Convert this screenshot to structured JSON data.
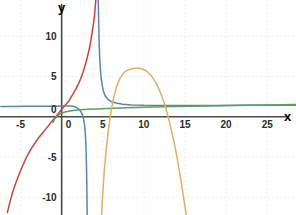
{
  "chart_data": {
    "type": "line",
    "title": "",
    "xlabel": "x",
    "ylabel": "y",
    "xlim": [
      -7.5,
      28.5
    ],
    "ylim": [
      -12.2,
      14.5
    ],
    "grid": true,
    "grid_style": "dotted",
    "grid_color": "#ececec",
    "background": "#fefefe",
    "axis_color": "#4a4a4a",
    "legend": "none",
    "xticks": [
      -5,
      0,
      5,
      10,
      15,
      20,
      25
    ],
    "xtick_labels": [
      "-5",
      "0",
      "5",
      "10",
      "15",
      "20",
      "25"
    ],
    "yticks": [
      10,
      5,
      0,
      -5,
      -10
    ],
    "ytick_labels": [
      "10",
      "5",
      "0",
      "-5",
      "-10"
    ],
    "origin_label": "0",
    "series": [
      {
        "name": "red-curve",
        "color": "#c9453c",
        "description": "steep increasing curve, x-intercept near -1.2, near-vertical rise at x=4",
        "points": [
          [
            -6.6,
            -11.9
          ],
          [
            -6.3,
            -10.6
          ],
          [
            -6.0,
            -9.5
          ],
          [
            -5.6,
            -8.3
          ],
          [
            -5.2,
            -7.2
          ],
          [
            -4.8,
            -6.2
          ],
          [
            -4.4,
            -5.3
          ],
          [
            -4.0,
            -4.5
          ],
          [
            -3.6,
            -3.8
          ],
          [
            -3.2,
            -3.2
          ],
          [
            -2.8,
            -2.6
          ],
          [
            -2.4,
            -2.1
          ],
          [
            -2.0,
            -1.6
          ],
          [
            -1.6,
            -1.1
          ],
          [
            -1.2,
            -0.6
          ],
          [
            -0.8,
            -0.1
          ],
          [
            -0.4,
            0.4
          ],
          [
            0.0,
            0.9
          ],
          [
            0.4,
            1.4
          ],
          [
            0.9,
            2.0
          ],
          [
            1.3,
            2.7
          ],
          [
            1.7,
            3.4
          ],
          [
            2.1,
            4.2
          ],
          [
            2.5,
            5.2
          ],
          [
            2.8,
            6.2
          ],
          [
            3.1,
            7.3
          ],
          [
            3.4,
            8.6
          ],
          [
            3.6,
            9.8
          ],
          [
            3.8,
            11.1
          ],
          [
            4.0,
            12.6
          ],
          [
            4.15,
            14.5
          ]
        ]
      },
      {
        "name": "blue-curve",
        "color": "#5b86ab",
        "description": "rational curve with vertical asymptote at x=4.55; left branch falls to -inf, right branch decays to horizontal asymptote y=1.35",
        "asymptote_x": 4.55,
        "asymptote_y": 1.35,
        "branch_left": [
          [
            -7.4,
            1.28
          ],
          [
            -6.0,
            1.28
          ],
          [
            -4.0,
            1.29
          ],
          [
            -2.0,
            1.3
          ],
          [
            -1.0,
            1.31
          ],
          [
            0.0,
            1.33
          ],
          [
            0.6,
            1.34
          ],
          [
            1.1,
            1.33
          ],
          [
            1.5,
            1.28
          ],
          [
            1.8,
            1.16
          ],
          [
            2.0,
            1.02
          ],
          [
            2.2,
            0.82
          ],
          [
            2.35,
            0.6
          ],
          [
            2.5,
            0.3
          ],
          [
            2.6,
            0.0
          ],
          [
            2.7,
            -0.45
          ],
          [
            2.78,
            -1.0
          ],
          [
            2.85,
            -1.7
          ],
          [
            2.9,
            -2.5
          ],
          [
            2.95,
            -3.5
          ],
          [
            2.99,
            -4.8
          ],
          [
            3.02,
            -6.2
          ],
          [
            3.05,
            -7.8
          ],
          [
            3.07,
            -9.4
          ],
          [
            3.09,
            -11.0
          ],
          [
            3.1,
            -12.2
          ]
        ],
        "branch_right": [
          [
            4.45,
            14.5
          ],
          [
            4.5,
            12.0
          ],
          [
            4.55,
            9.5
          ],
          [
            4.62,
            7.5
          ],
          [
            4.7,
            6.0
          ],
          [
            4.8,
            4.8
          ],
          [
            4.95,
            3.8
          ],
          [
            5.1,
            3.1
          ],
          [
            5.3,
            2.6
          ],
          [
            5.6,
            2.2
          ],
          [
            6.0,
            1.9
          ],
          [
            6.6,
            1.7
          ],
          [
            7.4,
            1.55
          ],
          [
            8.5,
            1.47
          ],
          [
            10.0,
            1.42
          ],
          [
            12.0,
            1.4
          ],
          [
            15.0,
            1.39
          ],
          [
            19.0,
            1.4
          ],
          [
            23.0,
            1.42
          ],
          [
            28.5,
            1.44
          ]
        ]
      },
      {
        "name": "green-curve",
        "color": "#5e9e5e",
        "description": "slowly increasing logarithmic-like curve from y=-0.6 at x=-1 up to y=1.5 at x=28",
        "points": [
          [
            -1.05,
            -0.7
          ],
          [
            -0.9,
            -0.35
          ],
          [
            -0.7,
            -0.05
          ],
          [
            -0.4,
            0.22
          ],
          [
            0.0,
            0.45
          ],
          [
            0.5,
            0.62
          ],
          [
            1.0,
            0.72
          ],
          [
            1.6,
            0.8
          ],
          [
            2.3,
            0.86
          ],
          [
            3.2,
            0.92
          ],
          [
            4.2,
            0.97
          ],
          [
            5.5,
            1.02
          ],
          [
            7.0,
            1.08
          ],
          [
            9.0,
            1.14
          ],
          [
            11.0,
            1.2
          ],
          [
            13.5,
            1.26
          ],
          [
            16.0,
            1.31
          ],
          [
            19.0,
            1.37
          ],
          [
            22.0,
            1.42
          ],
          [
            25.0,
            1.47
          ],
          [
            28.5,
            1.52
          ]
        ]
      },
      {
        "name": "orange-curve",
        "color": "#d9b26a",
        "description": "downward parabola, vertex approximately (9.3, 6.0), roots near 5.1 and 13.5",
        "vertex": [
          9.3,
          6.0
        ],
        "points": [
          [
            4.85,
            -12.2
          ],
          [
            5.0,
            -9.5
          ],
          [
            5.2,
            -6.5
          ],
          [
            5.45,
            -3.8
          ],
          [
            5.7,
            -1.5
          ],
          [
            6.0,
            0.6
          ],
          [
            6.3,
            2.3
          ],
          [
            6.7,
            3.8
          ],
          [
            7.1,
            4.8
          ],
          [
            7.6,
            5.5
          ],
          [
            8.1,
            5.85
          ],
          [
            8.7,
            6.0
          ],
          [
            9.3,
            6.05
          ],
          [
            9.9,
            5.9
          ],
          [
            10.4,
            5.6
          ],
          [
            10.9,
            5.1
          ],
          [
            11.4,
            4.3
          ],
          [
            11.8,
            3.5
          ],
          [
            12.2,
            2.5
          ],
          [
            12.6,
            1.3
          ],
          [
            13.0,
            -0.2
          ],
          [
            13.4,
            -1.9
          ],
          [
            13.8,
            -3.8
          ],
          [
            14.2,
            -6.0
          ],
          [
            14.6,
            -8.5
          ],
          [
            15.0,
            -11.2
          ],
          [
            15.15,
            -12.2
          ]
        ]
      }
    ]
  }
}
